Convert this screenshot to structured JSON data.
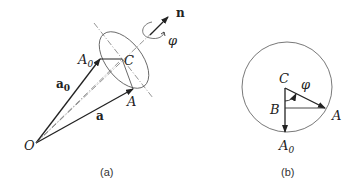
{
  "panel_a": {
    "caption": "(a)",
    "labels": {
      "n": "n",
      "phi": "φ",
      "A0": "A",
      "A0_sub": "0",
      "C": "C",
      "a0": "a",
      "a0_sub": "0",
      "A": "A",
      "a": "a",
      "O": "O"
    }
  },
  "panel_b": {
    "caption": "(b)",
    "labels": {
      "C": "C",
      "phi": "φ",
      "B": "B",
      "A": "A",
      "A0": "A",
      "A0_sub": "0"
    }
  }
}
